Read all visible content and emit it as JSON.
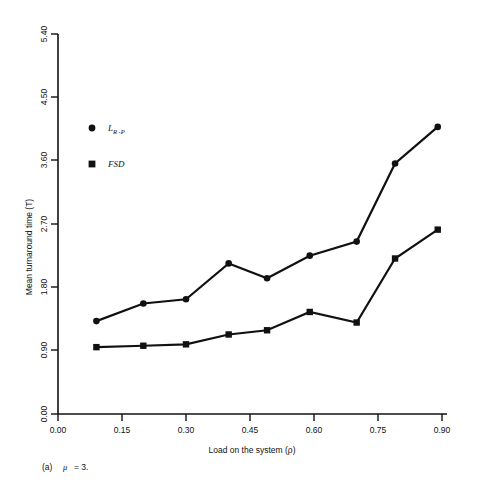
{
  "figure": {
    "caption_prefix": "(a)",
    "caption_symbol": "μ",
    "caption_value": "= 3."
  },
  "chart_data": {
    "type": "line",
    "title": "",
    "xlabel": "Load on the system (ρ)",
    "ylabel": "Mean turnaround time (T)",
    "xlim": [
      0.0,
      0.9
    ],
    "ylim": [
      0.0,
      5.4
    ],
    "xticks": [
      "0.00",
      "0.15",
      "0.30",
      "0.45",
      "0.60",
      "0.75",
      "0.90"
    ],
    "xtick_values": [
      0.0,
      0.15,
      0.3,
      0.45,
      0.6,
      0.75,
      0.9
    ],
    "yticks": [
      "0.00",
      "0.90",
      "1.80",
      "2.70",
      "3.60",
      "4.50",
      "5.40"
    ],
    "ytick_values": [
      0.0,
      0.9,
      1.8,
      2.7,
      3.6,
      4.5,
      5.4
    ],
    "grid": false,
    "legend_position": "upper-left-inside",
    "x": [
      0.09,
      0.2,
      0.3,
      0.4,
      0.49,
      0.59,
      0.7,
      0.79,
      0.89
    ],
    "series": [
      {
        "name": "L_R-P",
        "label_main": "L",
        "label_sub": "R -P",
        "marker": "circle",
        "color": "#111111",
        "values": [
          1.32,
          1.57,
          1.63,
          2.14,
          1.93,
          2.25,
          2.45,
          3.56,
          4.08
        ]
      },
      {
        "name": "FSD",
        "label_main": "FSD",
        "label_sub": "",
        "marker": "square",
        "color": "#111111",
        "values": [
          0.95,
          0.97,
          0.99,
          1.13,
          1.19,
          1.45,
          1.3,
          2.21,
          2.62
        ]
      }
    ]
  }
}
